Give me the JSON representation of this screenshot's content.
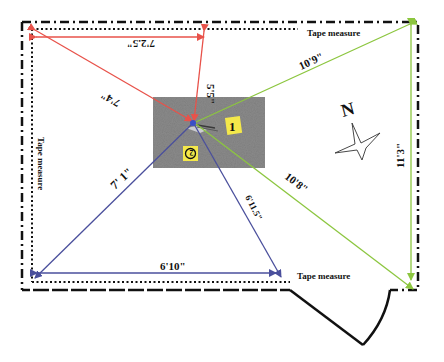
{
  "diagram": {
    "colors": {
      "red": "#e8524a",
      "green": "#8cc63f",
      "blue": "#4a4f9c",
      "black": "#111111",
      "photo_bg": "#8a8a8a",
      "marker_yellow": "#f4e84a"
    },
    "tape_labels": {
      "top": "Tape measure",
      "left": "Tape measure",
      "bottom": "Tape measure"
    },
    "measurements": {
      "red_top": "7'2.5\"",
      "red_vertical": "5'5\"",
      "red_diagonal": "7'4\"",
      "green_diagonal_top": "10'9\"",
      "green_diagonal_bottom": "10'8\"",
      "green_vertical": "11'3\"",
      "blue_diagonal_left": "7' 1\"",
      "blue_diagonal_right": "6'11.5\"",
      "blue_bottom": "6'10\""
    },
    "markers": {
      "marker_1": "1",
      "marker_2": "2"
    },
    "compass": {
      "label": "N",
      "icon": "compass-star-icon"
    }
  }
}
